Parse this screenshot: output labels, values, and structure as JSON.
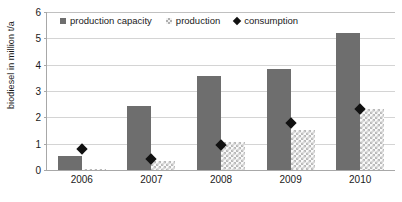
{
  "chart_data": {
    "type": "bar",
    "title": "",
    "subtitle": "",
    "xlabel": "",
    "ylabel": "biodiesel in million t/a",
    "categories": [
      "2006",
      "2007",
      "2008",
      "2009",
      "2010"
    ],
    "series": [
      {
        "name": "production capacity",
        "marker": "square",
        "color": "#6e6e6e",
        "render": "bar",
        "values": [
          0.55,
          2.43,
          3.57,
          3.84,
          5.2
        ]
      },
      {
        "name": "production",
        "marker": "checkered-square",
        "color": "#b9b9b9",
        "render": "bar",
        "values": [
          0.05,
          0.33,
          1.07,
          1.53,
          2.3
        ]
      },
      {
        "name": "consumption",
        "marker": "diamond",
        "color": "#111111",
        "render": "point",
        "values": [
          0.78,
          0.4,
          0.95,
          1.78,
          2.32
        ]
      }
    ],
    "ylim": [
      0,
      6
    ],
    "yticks": [
      0,
      1,
      2,
      3,
      4,
      5,
      6
    ],
    "ytick_labels": [
      "0",
      "1",
      "2",
      "3",
      "4",
      "5",
      "6"
    ],
    "grid": true,
    "grid_axis": "y",
    "legend_position": "top-left-inside"
  },
  "legend": {
    "items": [
      {
        "label": "production capacity",
        "icon": "square-swatch-icon"
      },
      {
        "label": "production",
        "icon": "checkered-swatch-icon"
      },
      {
        "label": "consumption",
        "icon": "diamond-swatch-icon"
      }
    ]
  }
}
